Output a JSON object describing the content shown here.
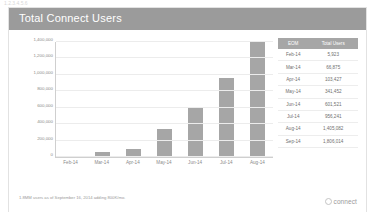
{
  "window": {
    "top_strip_text": "1.2.3.4.5.6"
  },
  "card": {
    "title": "Total Connect Users",
    "footnote": "1.8MM users as of September 16, 2014 adding 800K/mo.",
    "logo_text": "connect",
    "logo_icon": "circle-icon",
    "colors": {
      "title_bar": "#9b9b9b",
      "bar_fill": "#a6a6a6",
      "table_header": "#a6a6a6",
      "grid": "#ececec"
    }
  },
  "table": {
    "headers": [
      "EOM",
      "Total Users"
    ],
    "rows": [
      {
        "eom": "Feb-14",
        "users": "5,923"
      },
      {
        "eom": "Mar-14",
        "users": "66,875"
      },
      {
        "eom": "Apr-14",
        "users": "103,427"
      },
      {
        "eom": "May-14",
        "users": "341,452"
      },
      {
        "eom": "Jun-14",
        "users": "601,521"
      },
      {
        "eom": "Jul-14",
        "users": "956,241"
      },
      {
        "eom": "Aug-14",
        "users": "1,405,082"
      },
      {
        "eom": "Sep-14",
        "users": "1,806,014"
      }
    ]
  },
  "chart_data": {
    "type": "bar",
    "title": "Total Connect Users",
    "xlabel": "",
    "ylabel": "",
    "categories": [
      "Feb-14",
      "Mar-14",
      "Apr-14",
      "May-14",
      "Jun-14",
      "Jul-14",
      "Aug-14"
    ],
    "values": [
      5923,
      66875,
      103427,
      341452,
      601521,
      956241,
      1405082
    ],
    "ylim": [
      0,
      1400000
    ],
    "yticks": [
      0,
      200000,
      400000,
      600000,
      800000,
      1000000,
      1200000,
      1400000
    ],
    "ytick_labels": [
      "0",
      "200,000",
      "400,000",
      "600,000",
      "800,000",
      "1,000,000",
      "1,200,000",
      "1,400,000"
    ],
    "grid": true,
    "legend": false,
    "series_color": "#a6a6a6"
  }
}
